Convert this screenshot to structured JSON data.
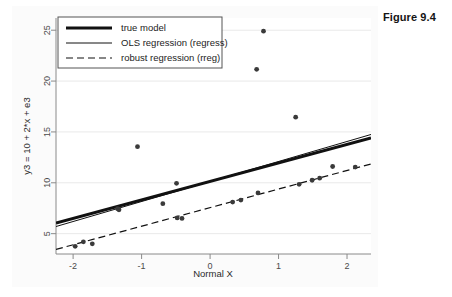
{
  "figure": {
    "caption": "Figure 9.4"
  },
  "chart_data": {
    "type": "scatter",
    "title": "",
    "xlabel": "Normal X",
    "ylabel": "y3 = 10 + 2*x + e3",
    "xlim": [
      -2.25,
      2.35
    ],
    "ylim": [
      3.0,
      26.2
    ],
    "xticks": [
      -2,
      -1,
      0,
      1,
      2
    ],
    "xtick_labels": [
      "-2",
      "-1",
      "0",
      "1",
      "2"
    ],
    "yticks": [
      5,
      10,
      15,
      20,
      25
    ],
    "ytick_labels": [
      "5",
      "10",
      "15",
      "20",
      "25"
    ],
    "grid": "horizontal",
    "legend_position": "top-left",
    "legend": [
      {
        "label": "true model",
        "style": "thick-solid"
      },
      {
        "label": "OLS regression (regress)",
        "style": "thin-solid"
      },
      {
        "label": "robust regression (rreg)",
        "style": "dashed"
      }
    ],
    "points": [
      {
        "x": -1.97,
        "y": 3.75
      },
      {
        "x": -1.85,
        "y": 4.2
      },
      {
        "x": -1.72,
        "y": 4.0
      },
      {
        "x": -1.35,
        "y": 7.45
      },
      {
        "x": -1.33,
        "y": 7.35
      },
      {
        "x": -1.06,
        "y": 13.55
      },
      {
        "x": -0.69,
        "y": 7.95
      },
      {
        "x": -0.49,
        "y": 9.95
      },
      {
        "x": -0.48,
        "y": 6.55
      },
      {
        "x": -0.41,
        "y": 6.5
      },
      {
        "x": 0.33,
        "y": 8.1
      },
      {
        "x": 0.45,
        "y": 8.3
      },
      {
        "x": 0.68,
        "y": 21.15
      },
      {
        "x": 0.7,
        "y": 9.0
      },
      {
        "x": 0.78,
        "y": 24.9
      },
      {
        "x": 1.25,
        "y": 16.45
      },
      {
        "x": 1.3,
        "y": 9.85
      },
      {
        "x": 1.49,
        "y": 10.25
      },
      {
        "x": 1.6,
        "y": 10.45
      },
      {
        "x": 1.79,
        "y": 11.6
      },
      {
        "x": 2.12,
        "y": 11.55
      }
    ],
    "lines": [
      {
        "name": "true model",
        "style": "thick-solid",
        "x0": -2.25,
        "y0": 6.05,
        "x1": 2.35,
        "y1": 14.4
      },
      {
        "name": "OLS regression (regress)",
        "style": "thin-solid",
        "x0": -2.25,
        "y0": 5.7,
        "x1": 2.35,
        "y1": 14.75
      },
      {
        "name": "robust regression (rreg)",
        "style": "dashed",
        "x0": -2.25,
        "y0": 3.45,
        "x1": 2.35,
        "y1": 11.85
      }
    ]
  }
}
